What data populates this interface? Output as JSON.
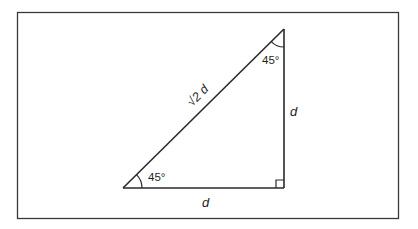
{
  "diagram": {
    "type": "right isosceles triangle",
    "colors": {
      "stroke": "#2a2a2a",
      "text": "#1f1f1f",
      "background": "#ffffff"
    },
    "frame": {
      "x": 17,
      "y": 12,
      "width": 382,
      "height": 207
    },
    "vertices": {
      "top": {
        "x": 284,
        "y": 29
      },
      "bottom_left": {
        "x": 123,
        "y": 188
      },
      "right_angle": {
        "x": 284,
        "y": 188
      }
    },
    "labels": {
      "hypotenuse": "√2 d",
      "vertical_side": "d",
      "base": "d",
      "top_angle": "45°",
      "bottom_left_angle": "45°"
    }
  }
}
